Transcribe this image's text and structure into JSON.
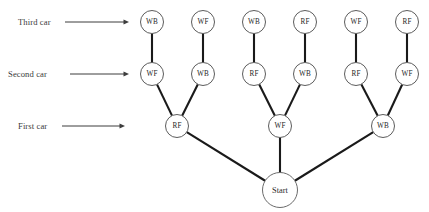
{
  "diagram": {
    "type": "tree",
    "title_visible": false,
    "colors": {
      "edge": "#1a1a1a",
      "node_stroke": "#4a4a4a",
      "node_fill": "#ffffff",
      "text": "#262626",
      "label_text": "#3a3a3a",
      "background": "#ffffff"
    },
    "root": {
      "id": "start",
      "label": "Start",
      "cx": 280,
      "cy": 190,
      "r": 17.5
    },
    "stage_labels": [
      {
        "id": "third-car",
        "label": "Third car",
        "text_x": 18,
        "text_y": 22,
        "arrow_x1": 65,
        "arrow_x2": 129,
        "arrow_y": 22
      },
      {
        "id": "second-car",
        "label": "Second car",
        "text_x": 8,
        "text_y": 74,
        "arrow_x1": 70,
        "arrow_x2": 129,
        "arrow_y": 74
      },
      {
        "id": "first-car",
        "label": "First car",
        "text_x": 18,
        "text_y": 126,
        "arrow_x1": 62,
        "arrow_x2": 125,
        "arrow_y": 126
      }
    ],
    "levels": [
      {
        "id": "level-third-car",
        "name": "Third car",
        "cy": 22
      },
      {
        "id": "level-second-car",
        "name": "Second car",
        "cy": 74
      },
      {
        "id": "level-first-car",
        "name": "First car",
        "cy": 126
      }
    ],
    "node_radius": 11.5,
    "nodes_level1": [
      {
        "id": "l1-n1",
        "label": "RF",
        "cx": 177,
        "cy": 126
      },
      {
        "id": "l1-n2",
        "label": "WF",
        "cx": 280,
        "cy": 126
      },
      {
        "id": "l1-n3",
        "label": "WB",
        "cx": 383,
        "cy": 126
      }
    ],
    "nodes_level2": [
      {
        "id": "l2-n1",
        "label": "WF",
        "cx": 152,
        "cy": 74,
        "parent": "l1-n1"
      },
      {
        "id": "l2-n2",
        "label": "WB",
        "cx": 203,
        "cy": 74,
        "parent": "l1-n1"
      },
      {
        "id": "l2-n3",
        "label": "RF",
        "cx": 254,
        "cy": 74,
        "parent": "l1-n2"
      },
      {
        "id": "l2-n4",
        "label": "WB",
        "cx": 305,
        "cy": 74,
        "parent": "l1-n2"
      },
      {
        "id": "l2-n5",
        "label": "RF",
        "cx": 356,
        "cy": 74,
        "parent": "l1-n3"
      },
      {
        "id": "l2-n6",
        "label": "WF",
        "cx": 407,
        "cy": 74,
        "parent": "l1-n3"
      }
    ],
    "nodes_level3": [
      {
        "id": "l3-n1",
        "label": "WB",
        "cx": 152,
        "cy": 22,
        "parent": "l2-n1"
      },
      {
        "id": "l3-n2",
        "label": "WF",
        "cx": 203,
        "cy": 22,
        "parent": "l2-n2"
      },
      {
        "id": "l3-n3",
        "label": "WB",
        "cx": 254,
        "cy": 22,
        "parent": "l2-n3"
      },
      {
        "id": "l3-n4",
        "label": "RF",
        "cx": 305,
        "cy": 22,
        "parent": "l2-n4"
      },
      {
        "id": "l3-n5",
        "label": "WF",
        "cx": 356,
        "cy": 22,
        "parent": "l2-n5"
      },
      {
        "id": "l3-n6",
        "label": "RF",
        "cx": 407,
        "cy": 22,
        "parent": "l2-n6"
      }
    ]
  }
}
